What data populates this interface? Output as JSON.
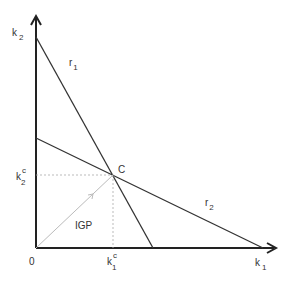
{
  "diagram": {
    "axes": {
      "x_label": "k",
      "x_label_sub": "1",
      "y_label": "k",
      "y_label_sub": "2",
      "origin_label": "0"
    },
    "lines": {
      "r1": {
        "label": "r",
        "label_sub": "1"
      },
      "r2": {
        "label": "r",
        "label_sub": "2"
      }
    },
    "point": {
      "label": "C",
      "x_label": "k",
      "x_label_sup": "c",
      "x_label_sub": "1",
      "y_label": "k",
      "y_label_sup": "c",
      "y_label_sub": "2"
    },
    "ray": {
      "label": "IGP"
    },
    "colors": {
      "axis": "#222222",
      "line": "#333333",
      "ray": "#bbbbbb",
      "dashed": "#aaaaaa",
      "text": "#333333"
    }
  }
}
